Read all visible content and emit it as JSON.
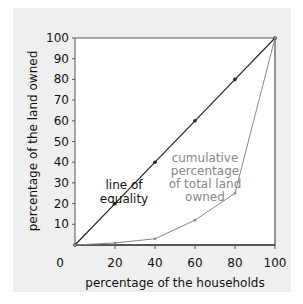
{
  "chart_data": {
    "type": "line",
    "title": "",
    "xlabel": "percentage of the households",
    "ylabel": "percentage of the land owned",
    "xlim": [
      0,
      100
    ],
    "ylim": [
      0,
      100
    ],
    "x_ticks": [
      "0",
      "20",
      "40",
      "60",
      "80",
      "100"
    ],
    "y_ticks": [
      "10",
      "20",
      "30",
      "40",
      "50",
      "60",
      "70",
      "80",
      "90",
      "100"
    ],
    "grid": false,
    "series": [
      {
        "name": "line of equality",
        "x": [
          0,
          20,
          40,
          60,
          80,
          100
        ],
        "values": [
          0,
          20,
          40,
          60,
          80,
          100
        ],
        "color": "#222222"
      },
      {
        "name": "cumulative percentage of total land owned",
        "x": [
          0,
          20,
          40,
          60,
          80,
          100
        ],
        "values": [
          0,
          1,
          3,
          12,
          25,
          100
        ],
        "color": "#888888"
      }
    ],
    "annotations": [
      {
        "text": [
          "line of",
          "equality"
        ],
        "color": "#111111"
      },
      {
        "text": [
          "cumulative",
          "percentage",
          "of total land",
          "owned"
        ],
        "color": "#888888"
      }
    ]
  }
}
